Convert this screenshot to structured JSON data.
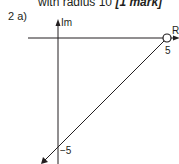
{
  "header": {
    "text": "with radius 10",
    "mark": "[1 mark]"
  },
  "question": {
    "label": "2  a)"
  },
  "diagram": {
    "type": "argand",
    "axes": {
      "imag_label": "Im",
      "real_label": "Re"
    },
    "ticks": {
      "real": "5",
      "imag": "−5"
    },
    "open_point": {
      "re": 5,
      "im": 0
    },
    "half_line": {
      "from": [
        5,
        0
      ],
      "direction": "towards -5i and beyond",
      "endpoint_included": false
    },
    "colors": {
      "stroke": "#231f20",
      "background": "#ffffff"
    }
  }
}
